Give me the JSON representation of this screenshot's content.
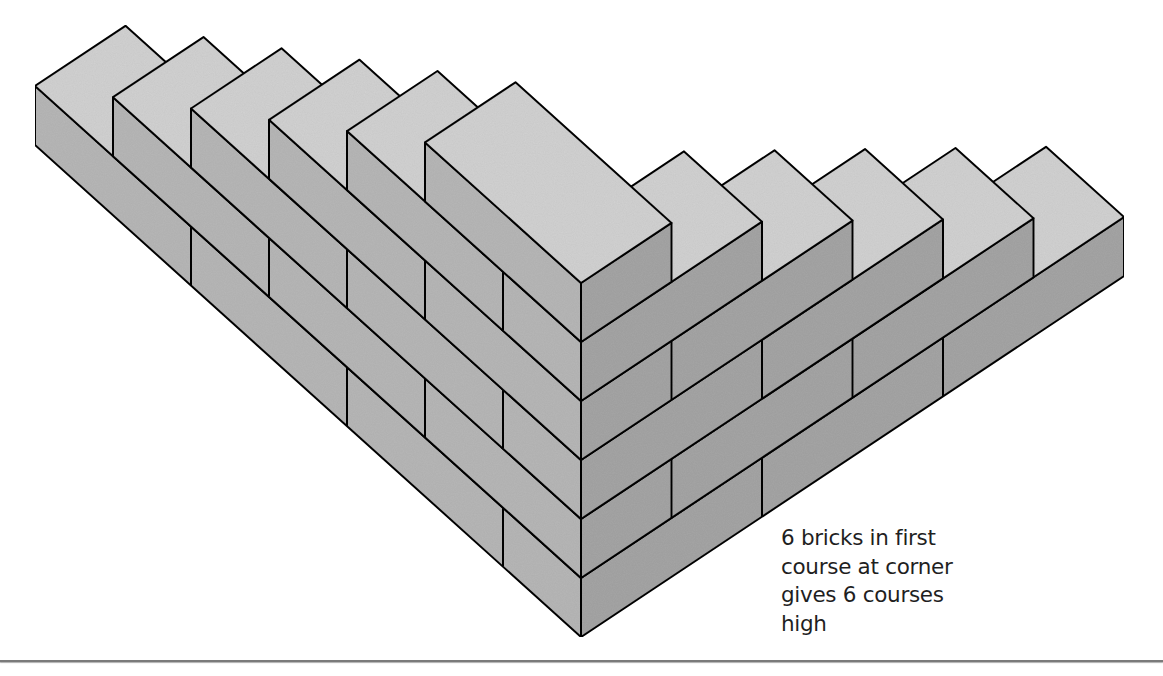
{
  "caption": {
    "lines": [
      "6 bricks in first",
      "course at corner",
      "gives 6 courses",
      "high"
    ]
  },
  "diagram": {
    "course_count": 6,
    "bricks_in_first_course_at_corner": 6,
    "courses": [
      {
        "index": 1,
        "left_wall_length": 3.5,
        "right_wall_length": 3.0,
        "left_joints": [
          0.5,
          1.5,
          2.5
        ],
        "right_joints": [
          1.0,
          2.0
        ]
      },
      {
        "index": 2,
        "left_wall_length": 3.0,
        "right_wall_length": 2.5,
        "left_joints": [
          1.0,
          2.0
        ],
        "right_joints": [
          0.5,
          1.5
        ]
      },
      {
        "index": 3,
        "left_wall_length": 2.5,
        "right_wall_length": 2.0,
        "left_joints": [
          0.5,
          1.5
        ],
        "right_joints": [
          1.0
        ]
      },
      {
        "index": 4,
        "left_wall_length": 2.0,
        "right_wall_length": 1.5,
        "left_joints": [
          1.0
        ],
        "right_joints": [
          0.5
        ]
      },
      {
        "index": 5,
        "left_wall_length": 1.5,
        "right_wall_length": 1.0,
        "left_joints": [
          0.5
        ],
        "right_joints": []
      },
      {
        "index": 6,
        "left_wall_length": 1.0,
        "right_wall_length": 0.5,
        "left_joints": [],
        "right_joints": []
      }
    ],
    "wall_thickness": 0.5,
    "colors": {
      "top_face": "#d2d2d2",
      "left_face": "#b7b7b7",
      "right_face": "#a5a5a5",
      "edge": "#111111",
      "rule": "#7a7a7a"
    }
  }
}
